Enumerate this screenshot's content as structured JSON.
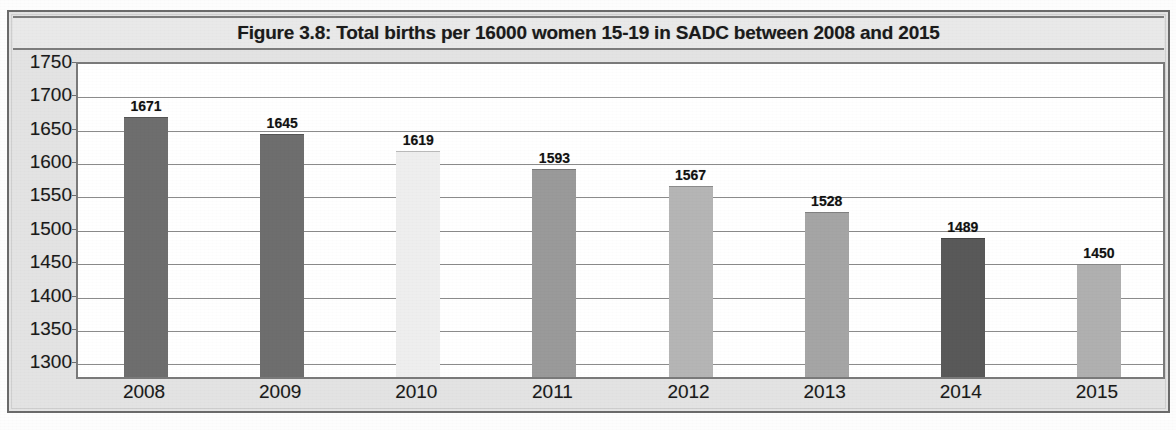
{
  "chart_data": {
    "type": "bar",
    "title": "Figure 3.8: Total births per 16000 women 15-19 in SADC between 2008 and 2015",
    "xlabel": "",
    "ylabel": "",
    "categories": [
      "2008",
      "2009",
      "2010",
      "2011",
      "2012",
      "2013",
      "2014",
      "2015"
    ],
    "values": [
      1671,
      1645,
      1619,
      1593,
      1567,
      1528,
      1489,
      1450
    ],
    "value_labels": [
      "1671",
      "1645",
      "1619",
      "1593",
      "1567",
      "1528",
      "1489",
      "1450"
    ],
    "bar_colors": [
      "#6e6e6e",
      "#6e6e6e",
      "#eeeeee",
      "#9a9a9a",
      "#b5b5b5",
      "#a5a5a5",
      "#595959",
      "#b0b0b0"
    ],
    "ylim": [
      1275,
      1750
    ],
    "yticks": [
      1750,
      1700,
      1650,
      1600,
      1550,
      1500,
      1450,
      1400,
      1350,
      1300
    ],
    "ytick_labels": [
      "1750",
      "1700",
      "1650",
      "1600",
      "1550",
      "1500",
      "1450",
      "1400",
      "1350",
      "1300"
    ],
    "grid": true,
    "grid_axis": "y",
    "legend": false,
    "legend_position": "none",
    "series": [
      {
        "name": "Total births per 16000 women 15-19",
        "values": [
          1671,
          1645,
          1619,
          1593,
          1567,
          1528,
          1489,
          1450
        ]
      }
    ]
  },
  "figure": {
    "plot_background": "#ffffff",
    "frame_background": "#e3e3e3",
    "gridline_color": "#8b8b8b",
    "axis_color": "#7a7a7a",
    "text_color": "#1a1a1a"
  },
  "page": {
    "footnote": ""
  }
}
